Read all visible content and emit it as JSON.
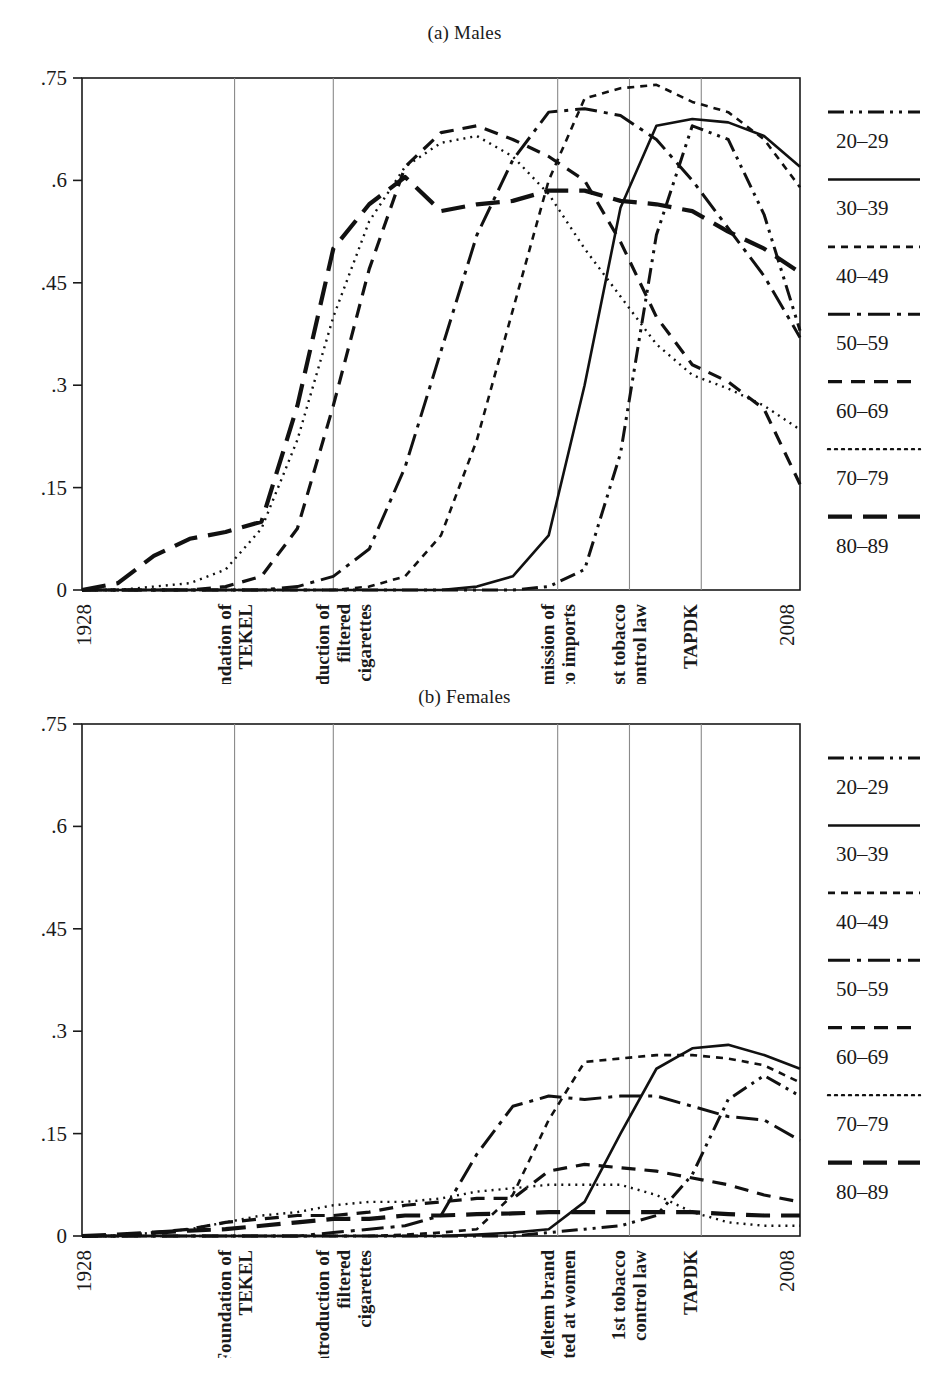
{
  "figure": {
    "panels": [
      {
        "id": "males",
        "title": "(a) Males"
      },
      {
        "id": "females",
        "title": "(b) Females"
      }
    ]
  },
  "legend": {
    "items": [
      {
        "label": "20–29",
        "style": "dash-dot-dot"
      },
      {
        "label": "30–39",
        "style": "solid"
      },
      {
        "label": "40–49",
        "style": "short-dash"
      },
      {
        "label": "50–59",
        "style": "long-dash-dot"
      },
      {
        "label": "60–69",
        "style": "medium-dash"
      },
      {
        "label": "70–79",
        "style": "dotted"
      },
      {
        "label": "80–89",
        "style": "long-dash"
      }
    ]
  },
  "chart_data": [
    {
      "type": "line",
      "title": "(a) Males",
      "xlabel": "",
      "ylabel": "",
      "xlim": [
        1928,
        2008
      ],
      "ylim": [
        0,
        0.75
      ],
      "yticks": [
        0,
        0.15,
        0.3,
        0.45,
        0.6,
        0.75
      ],
      "ytick_labels": [
        "0",
        ".15",
        ".3",
        ".45",
        ".6",
        ".75"
      ],
      "xticks": [
        1928,
        2008
      ],
      "xtick_labels": [
        "1928",
        "2008"
      ],
      "grid": "vertical-event-lines",
      "legend_position": "right",
      "event_lines": [
        {
          "year": 1945,
          "label": "Foundation of TEKEL"
        },
        {
          "year": 1956,
          "label": "Introduction of filtered cigarettes"
        },
        {
          "year": 1981,
          "label": "Permission of tobacco imports"
        },
        {
          "year": 1989,
          "label": "1st tobacco control law"
        },
        {
          "year": 1997,
          "label": "TAPDK"
        }
      ],
      "x": [
        1928,
        1932,
        1936,
        1940,
        1944,
        1948,
        1952,
        1956,
        1960,
        1964,
        1968,
        1972,
        1976,
        1980,
        1984,
        1988,
        1992,
        1996,
        2000,
        2004,
        2008
      ],
      "series": [
        {
          "name": "20–29",
          "style": "dash-dot-dot",
          "values": [
            0,
            0,
            0,
            0,
            0,
            0,
            0,
            0,
            0,
            0,
            0,
            0,
            0,
            0.005,
            0.03,
            0.2,
            0.52,
            0.68,
            0.66,
            0.55,
            0.38
          ]
        },
        {
          "name": "30–39",
          "style": "solid",
          "values": [
            0,
            0,
            0,
            0,
            0,
            0,
            0,
            0,
            0,
            0,
            0,
            0.005,
            0.02,
            0.08,
            0.3,
            0.56,
            0.68,
            0.69,
            0.685,
            0.665,
            0.62
          ]
        },
        {
          "name": "40–49",
          "style": "short-dash",
          "values": [
            0,
            0,
            0,
            0,
            0,
            0,
            0,
            0,
            0.005,
            0.02,
            0.08,
            0.22,
            0.41,
            0.6,
            0.72,
            0.735,
            0.74,
            0.715,
            0.7,
            0.66,
            0.59
          ]
        },
        {
          "name": "50–59",
          "style": "long-dash-dot",
          "values": [
            0,
            0,
            0,
            0,
            0,
            0,
            0.005,
            0.02,
            0.06,
            0.18,
            0.35,
            0.52,
            0.63,
            0.7,
            0.705,
            0.695,
            0.66,
            0.6,
            0.53,
            0.46,
            0.37
          ]
        },
        {
          "name": "60–69",
          "style": "medium-dash",
          "values": [
            0,
            0,
            0,
            0,
            0.005,
            0.02,
            0.09,
            0.27,
            0.47,
            0.62,
            0.67,
            0.68,
            0.66,
            0.635,
            0.6,
            0.51,
            0.4,
            0.33,
            0.305,
            0.265,
            0.155
          ]
        },
        {
          "name": "70–79",
          "style": "dotted",
          "values": [
            0,
            0,
            0.005,
            0.01,
            0.03,
            0.09,
            0.22,
            0.4,
            0.54,
            0.62,
            0.655,
            0.665,
            0.635,
            0.58,
            0.5,
            0.43,
            0.36,
            0.315,
            0.295,
            0.27,
            0.235
          ]
        },
        {
          "name": "80–89",
          "style": "long-dash",
          "values": [
            0,
            0.01,
            0.05,
            0.075,
            0.085,
            0.1,
            0.27,
            0.5,
            0.565,
            0.605,
            0.555,
            0.565,
            0.57,
            0.585,
            0.585,
            0.57,
            0.565,
            0.555,
            0.525,
            0.5,
            0.465
          ]
        }
      ]
    },
    {
      "type": "line",
      "title": "(b) Females",
      "xlabel": "",
      "ylabel": "",
      "xlim": [
        1928,
        2008
      ],
      "ylim": [
        0,
        0.75
      ],
      "yticks": [
        0,
        0.15,
        0.3,
        0.45,
        0.6,
        0.75
      ],
      "ytick_labels": [
        "0",
        ".15",
        ".3",
        ".45",
        ".6",
        ".75"
      ],
      "xticks": [
        1928,
        2008
      ],
      "xtick_labels": [
        "1928",
        "2008"
      ],
      "grid": "vertical-event-lines",
      "legend_position": "right",
      "event_lines": [
        {
          "year": 1945,
          "label": "Foundation of TEKEL"
        },
        {
          "year": 1956,
          "label": "Introduction of filtered cigarettes"
        },
        {
          "year": 1981,
          "label": "Meltem brand targeted at women"
        },
        {
          "year": 1989,
          "label": "1st tobacco control law"
        },
        {
          "year": 1997,
          "label": "TAPDK"
        }
      ],
      "x": [
        1928,
        1932,
        1936,
        1940,
        1944,
        1948,
        1952,
        1956,
        1960,
        1964,
        1968,
        1972,
        1976,
        1980,
        1984,
        1988,
        1992,
        1996,
        2000,
        2004,
        2008
      ],
      "series": [
        {
          "name": "20–29",
          "style": "dash-dot-dot",
          "values": [
            0,
            0,
            0,
            0,
            0,
            0,
            0,
            0,
            0,
            0,
            0,
            0,
            0,
            0.005,
            0.01,
            0.015,
            0.03,
            0.09,
            0.2,
            0.235,
            0.205
          ]
        },
        {
          "name": "30–39",
          "style": "solid",
          "values": [
            0,
            0,
            0,
            0,
            0,
            0,
            0,
            0,
            0,
            0,
            0,
            0.002,
            0.005,
            0.01,
            0.05,
            0.15,
            0.245,
            0.275,
            0.28,
            0.265,
            0.245
          ]
        },
        {
          "name": "40–49",
          "style": "short-dash",
          "values": [
            0,
            0,
            0,
            0,
            0,
            0,
            0,
            0,
            0,
            0.002,
            0.005,
            0.01,
            0.06,
            0.17,
            0.255,
            0.26,
            0.265,
            0.265,
            0.26,
            0.25,
            0.225
          ]
        },
        {
          "name": "50–59",
          "style": "long-dash-dot",
          "values": [
            0,
            0,
            0,
            0,
            0,
            0,
            0,
            0.005,
            0.01,
            0.015,
            0.03,
            0.12,
            0.19,
            0.205,
            0.2,
            0.205,
            0.205,
            0.19,
            0.175,
            0.17,
            0.14
          ]
        },
        {
          "name": "60–69",
          "style": "medium-dash",
          "values": [
            0,
            0,
            0.005,
            0.01,
            0.02,
            0.025,
            0.03,
            0.03,
            0.035,
            0.045,
            0.05,
            0.055,
            0.055,
            0.095,
            0.105,
            0.1,
            0.095,
            0.085,
            0.075,
            0.06,
            0.05
          ]
        },
        {
          "name": "70–79",
          "style": "dotted",
          "values": [
            0,
            0,
            0.005,
            0.01,
            0.02,
            0.03,
            0.035,
            0.045,
            0.05,
            0.05,
            0.055,
            0.065,
            0.07,
            0.075,
            0.075,
            0.075,
            0.06,
            0.035,
            0.02,
            0.015,
            0.015
          ]
        },
        {
          "name": "80–89",
          "style": "long-dash",
          "values": [
            0,
            0.002,
            0.005,
            0.008,
            0.01,
            0.015,
            0.02,
            0.025,
            0.025,
            0.03,
            0.03,
            0.032,
            0.033,
            0.035,
            0.035,
            0.035,
            0.035,
            0.035,
            0.032,
            0.03,
            0.03
          ]
        }
      ]
    }
  ]
}
